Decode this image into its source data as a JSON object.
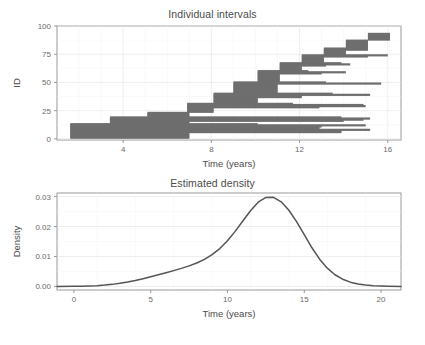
{
  "figure": {
    "background": "#ffffff",
    "bar_color": "#6e6e6e",
    "curve_color": "#555555",
    "axis_color": "#808080",
    "grid_color": "#ebebeb",
    "text_color": "#4a4a4a"
  },
  "panels": [
    {
      "id": "individual-intervals",
      "title": "Individual intervals",
      "xlabel": "Time (years)",
      "ylabel": "ID"
    },
    {
      "id": "estimated-density",
      "title": "Estimated density",
      "xlabel": "Time (years)",
      "ylabel": "Density"
    }
  ],
  "chart_data": [
    {
      "type": "bar",
      "orientation": "horizontal",
      "title": "Individual intervals",
      "xlabel": "Time (years)",
      "ylabel": "ID",
      "xlim": [
        1.0,
        16.6
      ],
      "ylim": [
        -1,
        100
      ],
      "xticks": [
        4,
        8,
        12,
        16
      ],
      "xtick_labels": [
        "4",
        "8",
        "12",
        "16"
      ],
      "yticks": [
        0,
        25,
        50,
        75,
        100
      ],
      "ytick_labels": [
        "0",
        "25",
        "50",
        "75",
        "100"
      ],
      "grid": true,
      "legend": "none",
      "description": "Censoring intervals (left, right) per subject ID, sorted by left endpoint",
      "intervals": [
        {
          "id": 1,
          "left": 1.6,
          "right": 7.0
        },
        {
          "id": 2,
          "left": 1.6,
          "right": 7.0
        },
        {
          "id": 3,
          "left": 1.6,
          "right": 7.0
        },
        {
          "id": 4,
          "left": 1.6,
          "right": 7.0
        },
        {
          "id": 5,
          "left": 1.6,
          "right": 7.0
        },
        {
          "id": 6,
          "left": 1.6,
          "right": 13.9
        },
        {
          "id": 7,
          "left": 1.6,
          "right": 13.9
        },
        {
          "id": 8,
          "left": 1.6,
          "right": 15.2
        },
        {
          "id": 9,
          "left": 1.6,
          "right": 12.9
        },
        {
          "id": 10,
          "left": 1.6,
          "right": 12.9
        },
        {
          "id": 11,
          "left": 1.6,
          "right": 13.0
        },
        {
          "id": 12,
          "left": 1.6,
          "right": 15.0
        },
        {
          "id": 13,
          "left": 1.6,
          "right": 10.1
        },
        {
          "id": 14,
          "left": 3.4,
          "right": 7.0
        },
        {
          "id": 15,
          "left": 3.4,
          "right": 7.0
        },
        {
          "id": 16,
          "left": 3.4,
          "right": 14.0
        },
        {
          "id": 17,
          "left": 3.4,
          "right": 14.9
        },
        {
          "id": 18,
          "left": 3.4,
          "right": 15.2
        },
        {
          "id": 19,
          "left": 3.4,
          "right": 13.9
        },
        {
          "id": 20,
          "left": 5.1,
          "right": 7.0
        },
        {
          "id": 21,
          "left": 5.1,
          "right": 7.0
        },
        {
          "id": 22,
          "left": 5.1,
          "right": 7.0
        },
        {
          "id": 23,
          "left": 5.1,
          "right": 7.0
        },
        {
          "id": 24,
          "left": 6.9,
          "right": 8.1
        },
        {
          "id": 25,
          "left": 6.9,
          "right": 8.1
        },
        {
          "id": 26,
          "left": 6.9,
          "right": 8.1
        },
        {
          "id": 27,
          "left": 6.9,
          "right": 8.1
        },
        {
          "id": 28,
          "left": 6.9,
          "right": 12.9
        },
        {
          "id": 29,
          "left": 6.9,
          "right": 15.0
        },
        {
          "id": 30,
          "left": 6.9,
          "right": 14.9
        },
        {
          "id": 31,
          "left": 6.9,
          "right": 11.7
        },
        {
          "id": 32,
          "left": 8.1,
          "right": 10.1
        },
        {
          "id": 33,
          "left": 8.1,
          "right": 10.1
        },
        {
          "id": 34,
          "left": 8.1,
          "right": 10.1
        },
        {
          "id": 35,
          "left": 8.1,
          "right": 10.1
        },
        {
          "id": 36,
          "left": 8.1,
          "right": 10.1
        },
        {
          "id": 37,
          "left": 8.1,
          "right": 12.1
        },
        {
          "id": 38,
          "left": 8.1,
          "right": 12.1
        },
        {
          "id": 39,
          "left": 8.1,
          "right": 15.2
        },
        {
          "id": 40,
          "left": 8.1,
          "right": 13.5
        },
        {
          "id": 41,
          "left": 9.0,
          "right": 11.0
        },
        {
          "id": 42,
          "left": 9.0,
          "right": 11.0
        },
        {
          "id": 43,
          "left": 9.0,
          "right": 11.0
        },
        {
          "id": 44,
          "left": 9.0,
          "right": 11.0
        },
        {
          "id": 45,
          "left": 9.0,
          "right": 11.0
        },
        {
          "id": 46,
          "left": 9.0,
          "right": 11.0
        },
        {
          "id": 47,
          "left": 9.0,
          "right": 11.0
        },
        {
          "id": 48,
          "left": 9.0,
          "right": 11.0
        },
        {
          "id": 49,
          "left": 9.0,
          "right": 15.7
        },
        {
          "id": 50,
          "left": 9.0,
          "right": 13.2
        },
        {
          "id": 51,
          "left": 10.1,
          "right": 11.1
        },
        {
          "id": 52,
          "left": 10.1,
          "right": 11.1
        },
        {
          "id": 53,
          "left": 10.1,
          "right": 11.1
        },
        {
          "id": 54,
          "left": 10.1,
          "right": 11.1
        },
        {
          "id": 55,
          "left": 10.1,
          "right": 11.1
        },
        {
          "id": 56,
          "left": 10.1,
          "right": 11.1
        },
        {
          "id": 57,
          "left": 10.1,
          "right": 11.1
        },
        {
          "id": 58,
          "left": 10.1,
          "right": 13.0
        },
        {
          "id": 59,
          "left": 10.1,
          "right": 14.1
        },
        {
          "id": 60,
          "left": 10.1,
          "right": 12.4
        },
        {
          "id": 61,
          "left": 11.1,
          "right": 12.1
        },
        {
          "id": 62,
          "left": 11.1,
          "right": 12.1
        },
        {
          "id": 63,
          "left": 11.1,
          "right": 12.1
        },
        {
          "id": 64,
          "left": 11.1,
          "right": 12.1
        },
        {
          "id": 65,
          "left": 11.1,
          "right": 13.2
        },
        {
          "id": 66,
          "left": 11.1,
          "right": 14.3
        },
        {
          "id": 67,
          "left": 11.1,
          "right": 13.9
        },
        {
          "id": 68,
          "left": 12.1,
          "right": 13.1
        },
        {
          "id": 69,
          "left": 12.1,
          "right": 13.1
        },
        {
          "id": 70,
          "left": 12.1,
          "right": 13.1
        },
        {
          "id": 71,
          "left": 12.1,
          "right": 13.1
        },
        {
          "id": 72,
          "left": 12.1,
          "right": 13.1
        },
        {
          "id": 73,
          "left": 12.1,
          "right": 15.1
        },
        {
          "id": 74,
          "left": 12.1,
          "right": 16.0
        },
        {
          "id": 75,
          "left": 13.1,
          "right": 14.1
        },
        {
          "id": 76,
          "left": 13.1,
          "right": 14.1
        },
        {
          "id": 77,
          "left": 13.1,
          "right": 14.1
        },
        {
          "id": 78,
          "left": 13.1,
          "right": 14.1
        },
        {
          "id": 79,
          "left": 13.1,
          "right": 15.1
        },
        {
          "id": 80,
          "left": 13.1,
          "right": 15.1
        },
        {
          "id": 81,
          "left": 14.1,
          "right": 15.1
        },
        {
          "id": 82,
          "left": 14.1,
          "right": 15.1
        },
        {
          "id": 83,
          "left": 14.1,
          "right": 15.1
        },
        {
          "id": 84,
          "left": 14.1,
          "right": 15.1
        },
        {
          "id": 85,
          "left": 14.1,
          "right": 15.1
        },
        {
          "id": 86,
          "left": 14.1,
          "right": 15.1
        },
        {
          "id": 87,
          "left": 14.1,
          "right": 15.1
        },
        {
          "id": 88,
          "left": 15.1,
          "right": 16.1
        },
        {
          "id": 89,
          "left": 15.1,
          "right": 16.1
        },
        {
          "id": 90,
          "left": 15.1,
          "right": 16.1
        },
        {
          "id": 91,
          "left": 15.1,
          "right": 16.1
        },
        {
          "id": 92,
          "left": 15.1,
          "right": 16.1
        },
        {
          "id": 93,
          "left": 15.1,
          "right": 16.1
        }
      ]
    },
    {
      "type": "line",
      "title": "Estimated density",
      "xlabel": "Time (years)",
      "ylabel": "Density",
      "xlim": [
        -1.1,
        21.3
      ],
      "ylim": [
        -0.0012,
        0.0312
      ],
      "xticks": [
        0,
        5,
        10,
        15,
        20
      ],
      "xtick_labels": [
        "0",
        "5",
        "10",
        "15",
        "20"
      ],
      "yticks": [
        0.0,
        0.01,
        0.02,
        0.03
      ],
      "ytick_labels": [
        "0.00",
        "0.01",
        "0.02",
        "0.03"
      ],
      "grid": true,
      "legend": "none",
      "series": [
        {
          "name": "Estimated density",
          "x": [
            -1.1,
            0.0,
            0.5,
            1.0,
            1.5,
            2.0,
            2.5,
            3.0,
            3.5,
            4.0,
            4.5,
            5.0,
            5.5,
            6.0,
            6.5,
            7.0,
            7.5,
            8.0,
            8.5,
            9.0,
            9.5,
            10.0,
            10.5,
            11.0,
            11.5,
            12.0,
            12.5,
            13.0,
            13.5,
            14.0,
            14.5,
            15.0,
            15.5,
            16.0,
            16.5,
            17.0,
            17.5,
            18.0,
            18.5,
            19.0,
            19.5,
            20.0,
            20.5,
            21.3
          ],
          "y": [
            0.0,
            4e-05,
            8e-05,
            0.00015,
            0.00026,
            0.00043,
            0.00068,
            0.00102,
            0.00146,
            0.00199,
            0.00259,
            0.00323,
            0.00389,
            0.00457,
            0.00527,
            0.00602,
            0.00685,
            0.00783,
            0.00905,
            0.01062,
            0.01265,
            0.01522,
            0.01838,
            0.02185,
            0.02527,
            0.02812,
            0.02973,
            0.02975,
            0.02825,
            0.02545,
            0.02165,
            0.01727,
            0.0129,
            0.0091,
            0.0061,
            0.0039,
            0.0024,
            0.00142,
            0.00082,
            0.00046,
            0.00025,
            0.00013,
            6e-05,
            0.0
          ]
        }
      ]
    }
  ]
}
